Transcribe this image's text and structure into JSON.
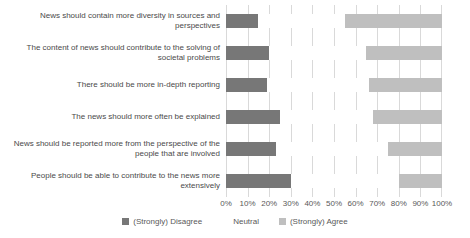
{
  "chart_data": {
    "type": "bar",
    "subtype": "horizontal-stacked-100",
    "orientation": "horizontal",
    "title": "",
    "xlabel": "",
    "ylabel": "",
    "categories": [
      "News should contain more diversity in sources and perspectives",
      "The content of news should contribute to the solving of societal problems",
      "There should be more in-depth reporting",
      "The news should more often be explained",
      "News should be reported more from the perspective of the people that are involved",
      "People should be able to contribute to the news more extensively"
    ],
    "series": [
      {
        "name": "(Strongly) Disagree",
        "color": "#777777",
        "values": [
          15,
          20,
          19,
          25,
          23,
          30
        ]
      },
      {
        "name": "Neutral",
        "color": "#ffffff",
        "values": [
          40,
          45,
          47,
          43,
          52,
          50
        ]
      },
      {
        "name": "(Strongly) Agree",
        "color": "#bfbfbf",
        "values": [
          45,
          35,
          34,
          32,
          25,
          20
        ]
      }
    ],
    "x_axis": {
      "min": 0,
      "max": 100,
      "tick_step": 10,
      "ticks": [
        "0%",
        "10%",
        "20%",
        "30%",
        "40%",
        "50%",
        "60%",
        "70%",
        "80%",
        "90%",
        "100%"
      ],
      "grid": true,
      "gridline_color": "#d9d9d9"
    },
    "legend": {
      "position": "bottom"
    }
  },
  "colors": {
    "background": "#ffffff",
    "category_text": "#4a4a4a",
    "axis_text": "#595959"
  }
}
